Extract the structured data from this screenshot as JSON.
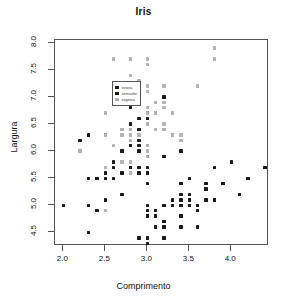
{
  "chart_data": {
    "type": "scatter",
    "title": "Iris",
    "xlabel": "Comprimento",
    "ylabel": "Largura",
    "xlim": [
      1.9,
      4.45
    ],
    "ylim": [
      4.25,
      8.05
    ],
    "xticks": [
      "2.0",
      "2.5",
      "3.0",
      "3.5",
      "4.0"
    ],
    "xtick_values": [
      2.0,
      2.5,
      3.0,
      3.5,
      4.0
    ],
    "yticks": [
      "4.5",
      "5.0",
      "5.5",
      "6.0",
      "6.5",
      "7.0",
      "7.5",
      "8.0"
    ],
    "ytick_values": [
      4.5,
      5.0,
      5.5,
      6.0,
      6.5,
      7.0,
      7.5,
      8.0
    ],
    "grid": false,
    "legend_position": "top-left",
    "marker": "filled-square",
    "series": [
      {
        "name": "setosa",
        "color": "#1a1a1a",
        "points": [
          [
            3.5,
            5.1
          ],
          [
            3.0,
            4.9
          ],
          [
            3.2,
            4.7
          ],
          [
            3.1,
            4.6
          ],
          [
            3.6,
            5.0
          ],
          [
            3.9,
            5.4
          ],
          [
            3.4,
            4.6
          ],
          [
            3.4,
            5.0
          ],
          [
            2.9,
            4.4
          ],
          [
            3.1,
            4.9
          ],
          [
            3.7,
            5.4
          ],
          [
            3.4,
            4.8
          ],
          [
            3.0,
            4.8
          ],
          [
            3.0,
            4.3
          ],
          [
            4.0,
            5.8
          ],
          [
            4.4,
            5.7
          ],
          [
            3.9,
            5.4
          ],
          [
            3.5,
            5.1
          ],
          [
            3.8,
            5.7
          ],
          [
            3.8,
            5.1
          ],
          [
            3.4,
            5.4
          ],
          [
            3.7,
            5.1
          ],
          [
            3.6,
            4.6
          ],
          [
            3.3,
            5.1
          ],
          [
            3.4,
            4.8
          ],
          [
            3.0,
            5.0
          ],
          [
            3.4,
            5.0
          ],
          [
            3.5,
            5.2
          ],
          [
            3.4,
            5.2
          ],
          [
            3.2,
            4.7
          ],
          [
            3.1,
            4.8
          ],
          [
            3.4,
            5.4
          ],
          [
            4.1,
            5.2
          ],
          [
            4.2,
            5.5
          ],
          [
            3.1,
            4.9
          ],
          [
            3.2,
            5.0
          ],
          [
            3.5,
            5.5
          ],
          [
            3.6,
            4.9
          ],
          [
            3.0,
            4.4
          ],
          [
            3.4,
            5.1
          ],
          [
            3.5,
            5.0
          ],
          [
            2.3,
            4.5
          ],
          [
            3.2,
            4.4
          ],
          [
            3.5,
            5.0
          ],
          [
            3.8,
            5.1
          ],
          [
            3.0,
            4.8
          ],
          [
            3.8,
            5.1
          ],
          [
            3.2,
            4.6
          ],
          [
            3.7,
            5.3
          ],
          [
            3.3,
            5.0
          ]
        ]
      },
      {
        "name": "versicolor",
        "color": "#1a1a1a",
        "points": [
          [
            3.2,
            7.0
          ],
          [
            3.2,
            6.4
          ],
          [
            3.1,
            6.9
          ],
          [
            2.3,
            5.5
          ],
          [
            2.8,
            6.5
          ],
          [
            2.8,
            5.7
          ],
          [
            3.3,
            6.3
          ],
          [
            2.4,
            4.9
          ],
          [
            2.9,
            6.6
          ],
          [
            2.7,
            5.2
          ],
          [
            2.0,
            5.0
          ],
          [
            3.0,
            5.9
          ],
          [
            2.2,
            6.0
          ],
          [
            2.9,
            6.1
          ],
          [
            2.9,
            5.6
          ],
          [
            3.1,
            6.7
          ],
          [
            3.0,
            5.6
          ],
          [
            2.7,
            5.8
          ],
          [
            2.2,
            6.2
          ],
          [
            2.5,
            5.6
          ],
          [
            3.2,
            5.9
          ],
          [
            2.8,
            6.1
          ],
          [
            2.5,
            6.3
          ],
          [
            2.8,
            6.1
          ],
          [
            2.9,
            6.4
          ],
          [
            3.0,
            6.6
          ],
          [
            2.8,
            6.8
          ],
          [
            3.0,
            6.7
          ],
          [
            2.9,
            6.0
          ],
          [
            2.6,
            5.7
          ],
          [
            2.4,
            5.5
          ],
          [
            2.4,
            5.5
          ],
          [
            2.7,
            5.8
          ],
          [
            2.7,
            6.0
          ],
          [
            3.0,
            5.4
          ],
          [
            3.4,
            6.0
          ],
          [
            3.1,
            6.7
          ],
          [
            2.3,
            6.3
          ],
          [
            3.0,
            5.6
          ],
          [
            2.5,
            5.5
          ],
          [
            2.6,
            5.5
          ],
          [
            3.0,
            6.1
          ],
          [
            2.6,
            5.8
          ],
          [
            2.3,
            5.0
          ],
          [
            2.7,
            5.6
          ],
          [
            3.0,
            5.7
          ],
          [
            2.9,
            5.7
          ],
          [
            2.9,
            6.2
          ],
          [
            2.5,
            5.1
          ],
          [
            2.8,
            5.7
          ]
        ]
      },
      {
        "name": "virginica",
        "color": "#b3b3b3",
        "points": [
          [
            3.3,
            6.3
          ],
          [
            2.7,
            5.8
          ],
          [
            3.0,
            7.1
          ],
          [
            2.9,
            6.3
          ],
          [
            3.0,
            6.5
          ],
          [
            3.0,
            7.6
          ],
          [
            2.5,
            4.9
          ],
          [
            2.9,
            7.3
          ],
          [
            2.5,
            6.7
          ],
          [
            3.6,
            7.2
          ],
          [
            3.2,
            6.5
          ],
          [
            2.7,
            6.4
          ],
          [
            3.0,
            6.8
          ],
          [
            2.5,
            5.7
          ],
          [
            2.8,
            5.8
          ],
          [
            3.2,
            6.4
          ],
          [
            3.0,
            6.5
          ],
          [
            3.8,
            7.7
          ],
          [
            2.6,
            7.7
          ],
          [
            2.2,
            6.0
          ],
          [
            3.2,
            6.9
          ],
          [
            2.8,
            5.6
          ],
          [
            2.8,
            7.7
          ],
          [
            2.7,
            6.3
          ],
          [
            3.3,
            6.7
          ],
          [
            3.2,
            7.2
          ],
          [
            2.8,
            6.2
          ],
          [
            3.0,
            6.1
          ],
          [
            2.8,
            6.4
          ],
          [
            3.0,
            7.2
          ],
          [
            2.8,
            7.4
          ],
          [
            3.8,
            7.9
          ],
          [
            2.8,
            6.4
          ],
          [
            2.8,
            6.3
          ],
          [
            2.6,
            6.1
          ],
          [
            3.0,
            7.7
          ],
          [
            3.4,
            6.3
          ],
          [
            3.1,
            6.4
          ],
          [
            3.0,
            6.0
          ],
          [
            3.1,
            6.9
          ],
          [
            3.1,
            6.7
          ],
          [
            3.1,
            6.9
          ],
          [
            2.7,
            5.8
          ],
          [
            3.2,
            6.8
          ],
          [
            3.3,
            6.7
          ],
          [
            3.0,
            6.7
          ],
          [
            2.5,
            6.3
          ],
          [
            3.0,
            6.5
          ],
          [
            3.4,
            6.2
          ],
          [
            3.0,
            5.9
          ]
        ]
      }
    ]
  },
  "legend": {
    "items": [
      {
        "label": "setosa",
        "color": "#1a1a1a"
      },
      {
        "label": "versicolor",
        "color": "#1a1a1a"
      },
      {
        "label": "virginica",
        "color": "#b3b3b3"
      }
    ]
  }
}
